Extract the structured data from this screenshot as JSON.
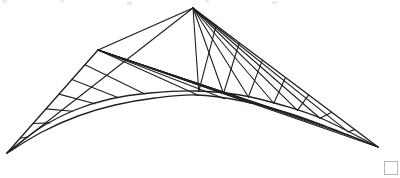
{
  "canvas": {
    "width": 400,
    "height": 178,
    "background": "#ffffff"
  },
  "figure": {
    "name": "hyperbolic-paraboloid-wireframe",
    "stroke_color": "#231f20",
    "stroke_width": 1.1,
    "edge_stroke_width": 1.35,
    "vertices": {
      "left_tip": [
        7,
        153
      ],
      "right_tip": [
        378,
        147
      ],
      "high_peak": [
        193,
        8
      ],
      "mid_peak": [
        98,
        50
      ],
      "valley_mid": [
        196,
        92
      ]
    },
    "curves": {
      "front_arch": {
        "label": "front-arch-curve",
        "points": [
          [
            7,
            153
          ],
          [
            40,
            128
          ],
          [
            75,
            110
          ],
          [
            110,
            99
          ],
          [
            150,
            93
          ],
          [
            196,
            91
          ],
          [
            240,
            95
          ],
          [
            285,
            106
          ],
          [
            325,
            120
          ],
          [
            378,
            147
          ]
        ]
      },
      "back_arch": {
        "label": "back-arch-curve",
        "points": [
          [
            7,
            153
          ],
          [
            42,
            132
          ],
          [
            78,
            116
          ],
          [
            115,
            105
          ],
          [
            155,
            98
          ],
          [
            196,
            95
          ],
          [
            242,
            101
          ],
          [
            288,
            113
          ],
          [
            330,
            128
          ],
          [
            378,
            147
          ]
        ]
      }
    },
    "rulings": {
      "right_panel_count": 7,
      "left_panel_count": 6,
      "note": "Straight generator lines span from the straight edges to the arched edges"
    }
  },
  "artifacts": {
    "corner_square": {
      "name": "page-corner-marker",
      "x": 384,
      "y": 161,
      "size": 14,
      "border_color": "#b9b9b9"
    },
    "top_smudges": [
      {
        "x": 2,
        "y": 0,
        "w": 5,
        "h": 3
      },
      {
        "x": 60,
        "y": 0,
        "w": 4,
        "h": 2
      },
      {
        "x": 127,
        "y": 1,
        "w": 5,
        "h": 4
      },
      {
        "x": 205,
        "y": 0,
        "w": 4,
        "h": 2
      },
      {
        "x": 272,
        "y": 1,
        "w": 5,
        "h": 3
      }
    ]
  }
}
